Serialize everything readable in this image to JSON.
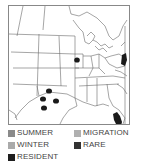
{
  "map": {
    "region": "Eastern United States",
    "border_color": "#888888",
    "line_color": "#666666",
    "occurrences": [
      {
        "type": "resident",
        "shape": "dot",
        "cx": 48,
        "cy": 89
      },
      {
        "type": "resident",
        "shape": "dot",
        "cx": 42,
        "cy": 96
      },
      {
        "type": "resident",
        "shape": "dot",
        "cx": 54,
        "cy": 98
      },
      {
        "type": "resident",
        "shape": "dot",
        "cx": 43,
        "cy": 106
      },
      {
        "type": "resident",
        "shape": "dot",
        "cx": 76,
        "cy": 58
      },
      {
        "type": "resident",
        "shape": "patch",
        "label": "mid-atlantic coast"
      },
      {
        "type": "resident",
        "shape": "patch",
        "label": "southern florida"
      }
    ]
  },
  "legend": {
    "items": [
      {
        "label": "SUMMER",
        "color": "#8a8a8a"
      },
      {
        "label": "MIGRATION",
        "color": "#b0b0b0"
      },
      {
        "label": "WINTER",
        "color": "#aaaaaa"
      },
      {
        "label": "RARE",
        "color": "#333333"
      },
      {
        "label": "RESIDENT",
        "color": "#1e1e1e"
      }
    ]
  }
}
